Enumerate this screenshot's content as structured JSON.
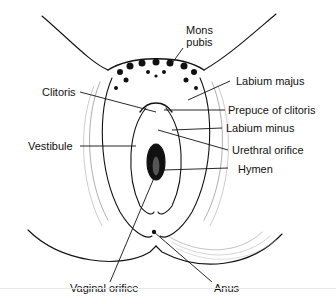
{
  "diagram": {
    "colors": {
      "ink": "#111111",
      "background": "#ffffff"
    },
    "labels": [
      {
        "id": "mons-pubis",
        "text_line1": "Mons",
        "text_line2": "pubis"
      },
      {
        "id": "labium-majus",
        "text": "Labium majus"
      },
      {
        "id": "clitoris",
        "text": "Clitoris"
      },
      {
        "id": "prepuce-of-clitoris",
        "text": "Prepuce of clitoris"
      },
      {
        "id": "labium-minus",
        "text": "Labium minus"
      },
      {
        "id": "vestibule",
        "text": "Vestibule"
      },
      {
        "id": "urethral-orifice",
        "text": "Urethral orifice"
      },
      {
        "id": "hymen",
        "text": "Hymen"
      },
      {
        "id": "vaginal-orifice",
        "text": "Vaginal orifice"
      },
      {
        "id": "anus",
        "text": "Anus"
      }
    ]
  }
}
